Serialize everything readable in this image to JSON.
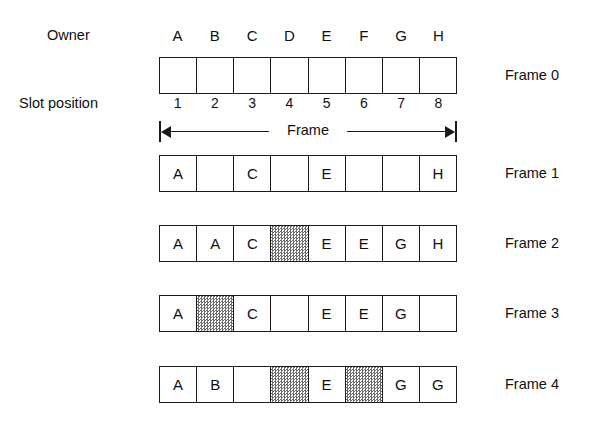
{
  "figure": {
    "labels": {
      "owner": "Owner",
      "slot_position": "Slot position",
      "frame_dimension": "Frame"
    },
    "owners": [
      "A",
      "B",
      "C",
      "D",
      "E",
      "F",
      "G",
      "H"
    ],
    "slot_numbers": [
      "1",
      "2",
      "3",
      "4",
      "5",
      "6",
      "7",
      "8"
    ],
    "colors": {
      "line": "#1a1a1a",
      "text": "#101010",
      "background": "#ffffff",
      "hatch": "#6e6e6e"
    },
    "rows": [
      {
        "label": "Frame 0",
        "cells": [
          {
            "text": "",
            "state": "empty"
          },
          {
            "text": "",
            "state": "empty"
          },
          {
            "text": "",
            "state": "empty"
          },
          {
            "text": "",
            "state": "empty"
          },
          {
            "text": "",
            "state": "empty"
          },
          {
            "text": "",
            "state": "empty"
          },
          {
            "text": "",
            "state": "empty"
          },
          {
            "text": "",
            "state": "empty"
          }
        ]
      },
      {
        "label": "Frame 1",
        "cells": [
          {
            "text": "A",
            "state": "owned"
          },
          {
            "text": "",
            "state": "empty"
          },
          {
            "text": "C",
            "state": "owned"
          },
          {
            "text": "",
            "state": "empty"
          },
          {
            "text": "E",
            "state": "owned"
          },
          {
            "text": "",
            "state": "empty"
          },
          {
            "text": "",
            "state": "empty"
          },
          {
            "text": "H",
            "state": "owned"
          }
        ]
      },
      {
        "label": "Frame 2",
        "cells": [
          {
            "text": "A",
            "state": "owned"
          },
          {
            "text": "A",
            "state": "owned"
          },
          {
            "text": "C",
            "state": "owned"
          },
          {
            "text": "",
            "state": "hatched"
          },
          {
            "text": "E",
            "state": "owned"
          },
          {
            "text": "E",
            "state": "owned"
          },
          {
            "text": "G",
            "state": "owned"
          },
          {
            "text": "H",
            "state": "owned"
          }
        ]
      },
      {
        "label": "Frame 3",
        "cells": [
          {
            "text": "A",
            "state": "owned"
          },
          {
            "text": "",
            "state": "hatched"
          },
          {
            "text": "C",
            "state": "owned"
          },
          {
            "text": "",
            "state": "empty"
          },
          {
            "text": "E",
            "state": "owned"
          },
          {
            "text": "E",
            "state": "owned"
          },
          {
            "text": "G",
            "state": "owned"
          },
          {
            "text": "",
            "state": "empty"
          }
        ]
      },
      {
        "label": "Frame 4",
        "cells": [
          {
            "text": "A",
            "state": "owned"
          },
          {
            "text": "B",
            "state": "owned"
          },
          {
            "text": "",
            "state": "empty"
          },
          {
            "text": "",
            "state": "hatched"
          },
          {
            "text": "E",
            "state": "owned"
          },
          {
            "text": "",
            "state": "hatched"
          },
          {
            "text": "G",
            "state": "owned"
          },
          {
            "text": "G",
            "state": "owned"
          }
        ]
      }
    ]
  }
}
